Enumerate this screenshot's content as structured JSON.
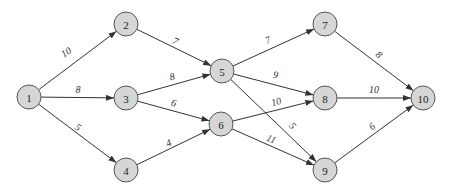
{
  "diagram": {
    "type": "directed-weighted-graph",
    "nodes": [
      {
        "id": "1",
        "label": "1",
        "x": 29,
        "y": 97
      },
      {
        "id": "2",
        "label": "2",
        "x": 126,
        "y": 24
      },
      {
        "id": "3",
        "label": "3",
        "x": 126,
        "y": 98
      },
      {
        "id": "4",
        "label": "4",
        "x": 126,
        "y": 170
      },
      {
        "id": "5",
        "label": "5",
        "x": 222,
        "y": 71
      },
      {
        "id": "6",
        "label": "6",
        "x": 221,
        "y": 124
      },
      {
        "id": "7",
        "label": "7",
        "x": 325,
        "y": 24
      },
      {
        "id": "8",
        "label": "8",
        "x": 325,
        "y": 98
      },
      {
        "id": "9",
        "label": "9",
        "x": 325,
        "y": 170
      },
      {
        "id": "10",
        "label": "10",
        "x": 423,
        "y": 98
      }
    ],
    "edges": [
      {
        "from": "1",
        "to": "2",
        "weight": "10",
        "lx": 68,
        "ly": 55,
        "rot": -33
      },
      {
        "from": "1",
        "to": "3",
        "weight": "8",
        "lx": 78,
        "ly": 93,
        "rot": 0
      },
      {
        "from": "1",
        "to": "4",
        "weight": "5",
        "lx": 76,
        "ly": 130,
        "rot": 35
      },
      {
        "from": "2",
        "to": "5",
        "weight": "7",
        "lx": 174,
        "ly": 44,
        "rot": 25
      },
      {
        "from": "3",
        "to": "5",
        "weight": "8",
        "lx": 173,
        "ly": 80,
        "rot": -14
      },
      {
        "from": "3",
        "to": "6",
        "weight": "6",
        "lx": 173,
        "ly": 106,
        "rot": 14
      },
      {
        "from": "4",
        "to": "6",
        "weight": "4",
        "lx": 170,
        "ly": 146,
        "rot": -25
      },
      {
        "from": "5",
        "to": "7",
        "weight": "7",
        "lx": 269,
        "ly": 43,
        "rot": -22
      },
      {
        "from": "5",
        "to": "8",
        "weight": "9",
        "lx": 275,
        "ly": 78,
        "rot": 12
      },
      {
        "from": "6",
        "to": "8",
        "weight": "10",
        "lx": 277,
        "ly": 105,
        "rot": -15
      },
      {
        "from": "5",
        "to": "9",
        "weight": "5",
        "lx": 290,
        "ly": 128,
        "rot": 50
      },
      {
        "from": "6",
        "to": "9",
        "weight": "11",
        "lx": 270,
        "ly": 142,
        "rot": 22
      },
      {
        "from": "7",
        "to": "10",
        "weight": "8",
        "lx": 377,
        "ly": 57,
        "rot": 40
      },
      {
        "from": "8",
        "to": "10",
        "weight": "10",
        "lx": 374,
        "ly": 93,
        "rot": 0
      },
      {
        "from": "9",
        "to": "10",
        "weight": "6",
        "lx": 374,
        "ly": 129,
        "rot": -38
      }
    ],
    "colors": {
      "node_fill": "#d6d6d6",
      "node_stroke": "#555555",
      "edge": "#333333"
    }
  }
}
